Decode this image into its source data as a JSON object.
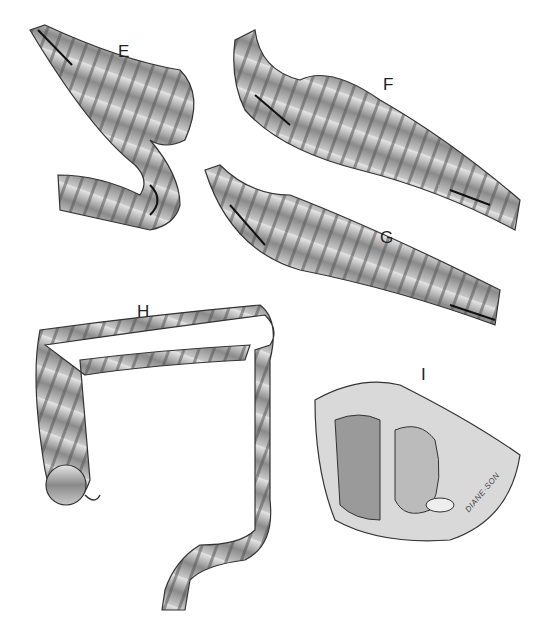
{
  "figure": {
    "panels": [
      {
        "id": "E",
        "label": "E",
        "subject": "intussusception loop with folded bowel segment and arrows"
      },
      {
        "id": "F",
        "label": "F",
        "subject": "telescoping bowel segment with directional arrows"
      },
      {
        "id": "G",
        "label": "G",
        "subject": "telescoping bowel segment with directional arrows"
      },
      {
        "id": "H",
        "label": "H",
        "subject": "large intestine (colon) overview with appendix"
      },
      {
        "id": "I",
        "label": "I",
        "subject": "sagittal pelvic section showing rectum"
      }
    ],
    "signature": "DIANE·SON",
    "colors": {
      "background": "#ffffff",
      "ink": "#222222",
      "shade_dark": "#555555",
      "shade_mid": "#9a9a9a",
      "shade_light": "#d6d6d6"
    }
  }
}
